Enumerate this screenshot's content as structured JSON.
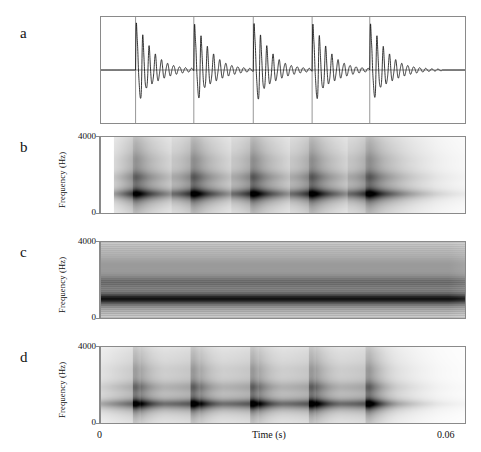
{
  "figure": {
    "background": "#ffffff",
    "ink": "#111111",
    "axis_color": "#8a8a8a"
  },
  "panels": [
    {
      "letter": "a",
      "kind": "waveform",
      "y_axis": {
        "label": "",
        "ticks": []
      },
      "description": "acoustic pressure waveform of five glottal pulse periods"
    },
    {
      "letter": "b",
      "kind": "spectrogram-broadband",
      "y_axis": {
        "label": "Frequency (Hz)",
        "ticks": [
          "4000",
          "0"
        ]
      },
      "description": "broadband spectrogram, vertical striations resolve individual glottal pulses"
    },
    {
      "letter": "c",
      "kind": "spectrogram-narrowband",
      "y_axis": {
        "label": "Frequency (Hz)",
        "ticks": [
          "4000",
          "0"
        ]
      },
      "description": "narrowband spectrogram, horizontal striations resolve harmonics"
    },
    {
      "letter": "d",
      "kind": "spectrogram-intermediate",
      "y_axis": {
        "label": "Frequency (Hz)",
        "ticks": [
          "4000",
          "0"
        ]
      },
      "description": "intermediate bandwidth spectrogram, both harmonic and pulse structure visible"
    }
  ],
  "x_axis": {
    "label": "Time (s)",
    "tick_min": "0",
    "tick_max": "0.06"
  },
  "chart_data": {
    "type": "line",
    "title": "",
    "xlabel": "Time (s)",
    "ylabel": "Frequency (Hz)",
    "xlim": [
      0,
      0.06
    ],
    "ylim": [
      0,
      4000
    ],
    "grid": false,
    "legend": "none",
    "x_tick_labels": [
      "0",
      "0.06"
    ],
    "y_tick_labels": [
      "0",
      "4000"
    ],
    "signal": {
      "fundamental_frequency_hz": 105,
      "period_s": 0.00952,
      "n_pulses": 5,
      "pulse_times_s": [
        0.0057,
        0.0153,
        0.0251,
        0.0348,
        0.0443
      ],
      "decay_time_constant_s": 0.003,
      "formants_hz": [
        1000,
        1900,
        2850,
        3700
      ],
      "formant_bandwidths_hz": [
        110,
        180,
        260,
        340
      ],
      "formant_amplitudes": [
        1.0,
        0.35,
        0.16,
        0.09
      ]
    },
    "series": [
      {
        "name": "a - waveform",
        "panel": "a",
        "type": "line",
        "ylabel": "",
        "values_description": "damped sinusoidal bursts, one per glottal pulse"
      },
      {
        "name": "b - broadband spectrogram",
        "panel": "b",
        "type": "heatmap",
        "analysis_bandwidth_hz": 300,
        "window_length_ms": 3.3,
        "resolves": "time (vertical striations)"
      },
      {
        "name": "c - narrowband spectrogram",
        "panel": "c",
        "type": "heatmap",
        "analysis_bandwidth_hz": 45,
        "window_length_ms": 22,
        "resolves": "frequency (horizontal harmonics)"
      },
      {
        "name": "d - intermediate spectrogram",
        "panel": "d",
        "type": "heatmap",
        "analysis_bandwidth_hz": 120,
        "window_length_ms": 8,
        "resolves": "both harmonics and pulses"
      }
    ]
  }
}
